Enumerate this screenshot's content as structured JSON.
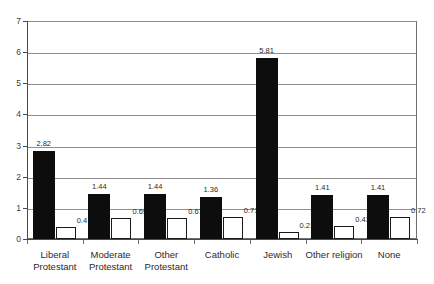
{
  "chart_data": {
    "type": "bar",
    "title": "",
    "subtitle": "",
    "xlabel": "",
    "ylabel": "",
    "ylim": [
      0,
      7
    ],
    "yticks": [
      0,
      1,
      2,
      3,
      4,
      5,
      6,
      7
    ],
    "grid": true,
    "legend": "none",
    "categories": [
      "Liberal Protestant",
      "Moderate Protestant",
      "Other Protestant",
      "Catholic",
      "Jewish",
      "Other religion",
      "None"
    ],
    "category_lines": [
      [
        "Liberal",
        "Protestant"
      ],
      [
        "Moderate",
        "Protestant"
      ],
      [
        "Other",
        "Protestant"
      ],
      [
        "Catholic"
      ],
      [
        "Jewish"
      ],
      [
        "Other religion"
      ],
      [
        "None"
      ]
    ],
    "series": [
      {
        "name": "series-1",
        "style": "filled-black",
        "color": "#0d0d0d",
        "values": [
          2.82,
          1.44,
          1.44,
          1.36,
          5.81,
          1.41,
          1.41
        ],
        "labels": [
          "2.82",
          "1.44",
          "1.44",
          "1.36",
          "5.81",
          "1.41",
          "1.41"
        ]
      },
      {
        "name": "series-2",
        "style": "hollow-white",
        "color": "#ffffff",
        "values": [
          0.4,
          0.69,
          0.67,
          0.71,
          0.21,
          0.43,
          0.72
        ],
        "labels": [
          "0.4",
          "0.69",
          "0.67",
          "0.71",
          "0.21",
          "0.43",
          "0.72"
        ]
      }
    ]
  },
  "axis": {
    "ytick_labels": [
      "7",
      "6",
      "5",
      "4",
      "3",
      "2",
      "1",
      "0"
    ]
  },
  "colors": {
    "gridline": "#8f8f8f",
    "axis": "#4a4a4a",
    "border": "#6e6e6e",
    "bar_filled": "#0d0d0d",
    "bar_hollow_border": "#1a1a1a",
    "text": "#2b2b2b",
    "background": "#ffffff"
  }
}
